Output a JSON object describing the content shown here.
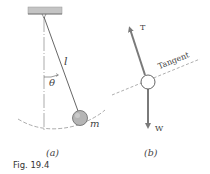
{
  "figure": {
    "caption": "Fig. 19.4",
    "panel_a": {
      "label": "(a)",
      "length_symbol": "l",
      "angle_symbol": "θ",
      "mass_symbol": "m"
    },
    "panel_b": {
      "label": "(b)",
      "tension_symbol": "T",
      "weight_symbol": "W",
      "tangent_label": "Tangent"
    },
    "colors": {
      "line": "#555555",
      "arrow": "#7a7a7a",
      "bob_fill": "#b5b5b5",
      "ceiling_fill": "#c4c4c4"
    }
  }
}
